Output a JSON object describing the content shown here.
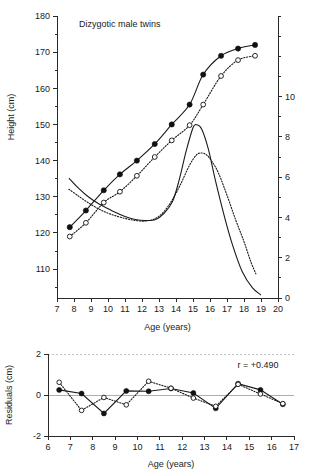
{
  "figure": {
    "panels": [
      "growth-curve-panel",
      "residuals-panel"
    ]
  },
  "chart_data": [
    {
      "id": "growth",
      "type": "line",
      "title": "Dizygotic male twins",
      "xlabel": "Age (years)",
      "ylabel": "Height (cm)",
      "y2label": "",
      "xlim": [
        7,
        20
      ],
      "ylim": [
        102,
        180
      ],
      "y2lim": [
        0,
        14
      ],
      "xticks": [
        7,
        8,
        9,
        10,
        11,
        12,
        13,
        14,
        15,
        16,
        17,
        18,
        19,
        20
      ],
      "xticklabels": [
        "7",
        "8",
        "9",
        "10",
        "11",
        "12",
        "13",
        "14",
        "15",
        "16",
        "17",
        "18",
        "19",
        "20"
      ],
      "yticks": [
        110,
        120,
        130,
        140,
        150,
        160,
        170,
        180
      ],
      "yticklabels": [
        "110",
        "120",
        "130",
        "140",
        "150",
        "160",
        "170",
        "180"
      ],
      "yminorticks": [
        105,
        115,
        125,
        135,
        145,
        155,
        165,
        175
      ],
      "y2ticks": [
        0,
        2,
        4,
        6,
        8,
        10
      ],
      "y2ticklabels": [
        "0",
        "2",
        "4",
        "6",
        "8",
        "10"
      ],
      "y2minorticks": [
        1,
        3,
        5,
        7,
        9,
        11,
        12,
        13,
        14
      ],
      "grid": false,
      "legend": "none",
      "series": [
        {
          "name": "Twin 1 height",
          "marker": "filled-circle",
          "line": "solid",
          "axis": "left",
          "x": [
            7.75,
            8.7,
            9.75,
            10.7,
            11.7,
            12.75,
            13.75,
            14.8,
            15.6,
            16.65,
            17.65,
            18.65
          ],
          "values": [
            121.6,
            126.2,
            131.8,
            136.2,
            140.0,
            144.6,
            150.0,
            155.5,
            163.8,
            169.0,
            171.0,
            172.0
          ]
        },
        {
          "name": "Twin 2 height",
          "marker": "open-circle",
          "line": "dotted",
          "axis": "left",
          "x": [
            7.75,
            8.7,
            9.75,
            10.7,
            11.7,
            12.75,
            13.75,
            14.8,
            15.6,
            16.65,
            17.65,
            18.65
          ],
          "values": [
            119.0,
            122.8,
            128.4,
            131.4,
            135.8,
            141.0,
            145.6,
            149.8,
            155.5,
            163.4,
            167.8,
            169.0
          ]
        },
        {
          "name": "Twin 1 height velocity",
          "marker": "none",
          "line": "solid",
          "axis": "right",
          "x": [
            7.7,
            8.2,
            8.8,
            9.5,
            10.2,
            11.0,
            11.6,
            12.2,
            12.8,
            13.3,
            13.8,
            14.2,
            14.6,
            15.0,
            15.2,
            15.5,
            15.9,
            16.3,
            16.8,
            17.3,
            17.9,
            18.5,
            19.0
          ],
          "values": [
            5.95,
            5.5,
            5.05,
            4.65,
            4.35,
            4.05,
            3.9,
            3.85,
            3.9,
            4.2,
            4.8,
            5.9,
            7.3,
            8.45,
            8.6,
            8.4,
            7.4,
            5.9,
            4.2,
            2.7,
            1.3,
            0.5,
            0.15
          ]
        },
        {
          "name": "Twin 2 height velocity",
          "marker": "none",
          "line": "dotted",
          "axis": "right",
          "x": [
            7.7,
            8.2,
            8.8,
            9.5,
            10.2,
            11.0,
            11.6,
            12.2,
            12.8,
            13.3,
            13.8,
            14.3,
            14.8,
            15.2,
            15.5,
            15.8,
            16.1,
            16.5,
            17.0,
            17.5,
            18.0,
            18.4,
            18.7
          ],
          "values": [
            5.4,
            5.1,
            4.75,
            4.4,
            4.15,
            3.95,
            3.85,
            3.82,
            3.95,
            4.3,
            4.9,
            5.7,
            6.6,
            7.1,
            7.2,
            7.1,
            6.8,
            6.2,
            5.1,
            3.9,
            2.8,
            1.8,
            1.2
          ]
        }
      ]
    },
    {
      "id": "residuals",
      "type": "line",
      "title": "",
      "xlabel": "Age (years)",
      "ylabel": "Residuals (cm)",
      "xlim": [
        6,
        17
      ],
      "ylim": [
        -2,
        2
      ],
      "xticks": [
        6,
        7,
        8,
        9,
        10,
        11,
        12,
        13,
        14,
        15,
        16,
        17
      ],
      "xticklabels": [
        "6",
        "7",
        "8",
        "9",
        "10",
        "11",
        "12",
        "13",
        "14",
        "15",
        "16",
        "17"
      ],
      "yticks": [
        -2,
        0,
        2
      ],
      "yticklabels": [
        "-2",
        "0",
        "2"
      ],
      "grid": false,
      "legend": "none",
      "annotation": "r = +0.490",
      "series": [
        {
          "name": "Twin 1 residuals",
          "marker": "filled-circle",
          "line": "solid",
          "x": [
            6.5,
            7.5,
            8.5,
            9.5,
            10.5,
            11.5,
            12.5,
            13.5,
            14.5,
            15.5,
            16.5
          ],
          "values": [
            0.25,
            0.07,
            -0.9,
            0.2,
            0.18,
            0.32,
            0.1,
            -0.65,
            0.55,
            0.25,
            -0.45
          ]
        },
        {
          "name": "Twin 2 residuals",
          "marker": "open-circle",
          "line": "dotted",
          "x": [
            6.5,
            7.5,
            8.5,
            9.5,
            10.5,
            11.5,
            12.5,
            13.5,
            14.5,
            15.5,
            16.5
          ],
          "values": [
            0.62,
            -0.75,
            -0.12,
            -0.48,
            0.67,
            0.33,
            -0.15,
            -0.55,
            0.52,
            0.05,
            -0.42
          ]
        }
      ]
    }
  ]
}
